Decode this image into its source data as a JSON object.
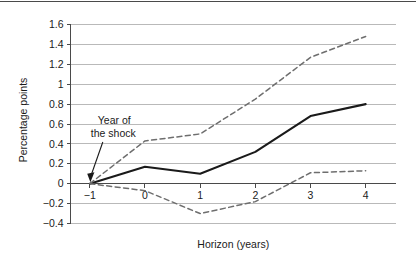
{
  "chart_data": {
    "type": "line",
    "title": "",
    "xlabel": "Horizon (years)",
    "ylabel": "Percentage points",
    "x": [
      -1,
      0,
      1,
      2,
      3,
      4
    ],
    "xticklabels": [
      "−1",
      "0",
      "1",
      "2",
      "3",
      "4"
    ],
    "yticklabels": [
      "−0.4",
      "−0.2",
      "0",
      "0.2",
      "0.4",
      "0.6",
      "0.8",
      "1",
      "1.2",
      "1.4",
      "1.6"
    ],
    "ytickvalues": [
      -0.4,
      -0.2,
      0,
      0.2,
      0.4,
      0.6,
      0.8,
      1.0,
      1.2,
      1.4,
      1.6
    ],
    "xlim": [
      -1.35,
      4.55
    ],
    "ylim": [
      -0.4,
      1.6
    ],
    "grid": true,
    "grid_axis": "y",
    "legend": "none",
    "zero_line": true,
    "series": [
      {
        "name": "point-estimate",
        "style": "solid",
        "color": "#1a1a1a",
        "values": [
          0.0,
          0.17,
          0.1,
          0.32,
          0.68,
          0.8
        ]
      },
      {
        "name": "upper-confidence-band",
        "style": "dashed",
        "color": "#6e6e6e",
        "values": [
          0.0,
          0.43,
          0.5,
          0.85,
          1.27,
          1.48
        ]
      },
      {
        "name": "lower-confidence-band",
        "style": "dashed",
        "color": "#6e6e6e",
        "values": [
          0.0,
          -0.07,
          -0.3,
          -0.18,
          0.11,
          0.13
        ]
      }
    ],
    "annotations": [
      {
        "name": "year-of-the-shock",
        "line1": "Year of",
        "line2": "the shock",
        "target_x": -1,
        "target_y": 0.0,
        "arrow": true
      }
    ],
    "colors": {
      "solid_line": "#1a1a1a",
      "dashed_line": "#6e6e6e",
      "gridline": "#b9b9b9",
      "axis": "#4a4a4a",
      "text": "#1a1a1a",
      "background": "#ffffff"
    }
  }
}
